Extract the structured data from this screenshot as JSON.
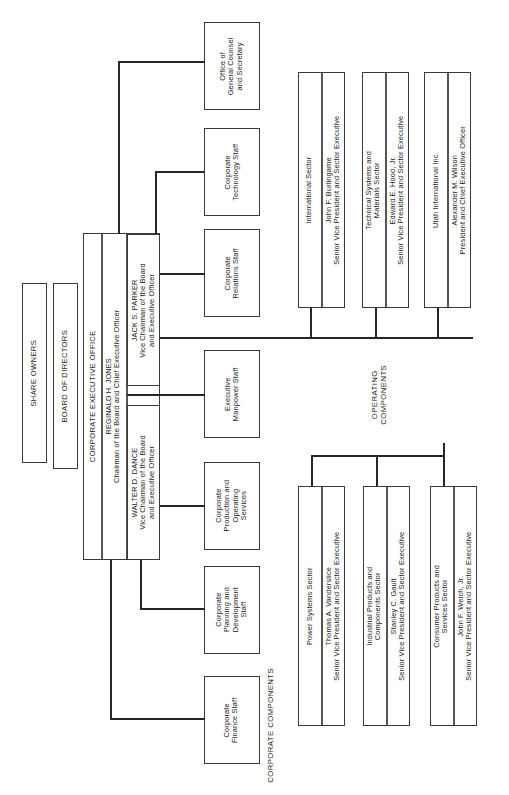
{
  "chart": {
    "type": "org-chart",
    "orientation": "rotated-90-ccw"
  },
  "top": {
    "share_owners": "SHARE OWNERS",
    "board_of_directors": "BOARD OF DIRECTORS"
  },
  "executive_office": {
    "header": "CORPORATE EXECUTIVE OFFICE",
    "chairman": {
      "name": "REGINALD H. JONES",
      "title": "Chairman of the Board and Chief Executive Officer"
    },
    "vice_chairmen": [
      {
        "name": "JACK S. PARKER",
        "title_line1": "Vice Chairman of the Board",
        "title_line2": "and Executive Officer"
      },
      {
        "name": "WALTER D. DANCE",
        "title_line1": "Vice Chairman of the Board",
        "title_line2": "and Executive Officer"
      }
    ]
  },
  "staff_units": [
    {
      "line1": "Office of",
      "line2": "General Counsel",
      "line3": "and Secretary"
    },
    {
      "line1": "Corporate",
      "line2": "Technology Staff",
      "line3": ""
    },
    {
      "line1": "Corporate",
      "line2": "Relations Staff",
      "line3": ""
    },
    {
      "line1": "Executive",
      "line2": "Manpower Staff",
      "line3": ""
    },
    {
      "line1": "Corporate",
      "line2": "Production and",
      "line3": "Operating",
      "line4": "Services"
    },
    {
      "line1": "Corporate",
      "line2": "Planning and",
      "line3": "Development",
      "line4": "Staff"
    },
    {
      "line1": "Corporate",
      "line2": "Finance Staff",
      "line3": ""
    }
  ],
  "group_labels": {
    "corporate_components": "CORPORATE COMPONENTS",
    "operating_components_line1": "OPERATING",
    "operating_components_line2": "COMPONENTS"
  },
  "operating_components": [
    {
      "unit_line1": "International Sector",
      "unit_line2": "",
      "exec_name": "John F. Burlingame",
      "exec_title": "Senior Vice President and Sector Executive"
    },
    {
      "unit_line1": "Technical Systems and",
      "unit_line2": "Materials Sector",
      "exec_name": "Edward E. Hood, Jr.",
      "exec_title": "Senior Vice President and Sector Executive"
    },
    {
      "unit_line1": "Utah International Inc.",
      "unit_line2": "",
      "exec_name": "Alexander M. Wilson",
      "exec_title": "President and Chief Executive Officer"
    },
    {
      "unit_line1": "Power Systems Sector",
      "unit_line2": "",
      "exec_name": "Thomas A. Vanderslice",
      "exec_title": "Senior Vice President and Sector Executive"
    },
    {
      "unit_line1": "Industrial Products and",
      "unit_line2": "Components Sector",
      "exec_name": "Stanley C. Gault",
      "exec_title": "Senior Vice President and Sector Executive"
    },
    {
      "unit_line1": "Consumer Products and",
      "unit_line2": "Services Sector",
      "exec_name": "John F. Welch, Jr.",
      "exec_title": "Senior Vice President and Sector Executive"
    }
  ]
}
